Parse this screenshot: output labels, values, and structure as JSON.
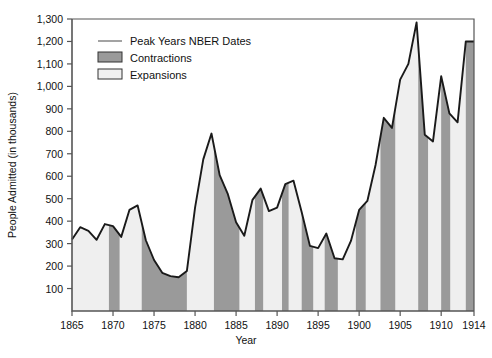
{
  "chart_data": {
    "type": "area",
    "title": "",
    "xlabel": "Year",
    "ylabel": "People Admitted (in thousands)",
    "xlim": [
      1865,
      1914
    ],
    "ylim": [
      0,
      1300
    ],
    "yticks": [
      100,
      200,
      300,
      400,
      500,
      600,
      700,
      800,
      900,
      1000,
      1100,
      1200,
      1300
    ],
    "ytick_labels": [
      "100",
      "200",
      "300",
      "400",
      "500",
      "600",
      "700",
      "800",
      "900",
      "1,000",
      "1,100",
      "1,200",
      "1,300"
    ],
    "xticks": [
      1865,
      1870,
      1875,
      1880,
      1885,
      1890,
      1895,
      1900,
      1905,
      1910,
      1914
    ],
    "xtick_labels": [
      "1865",
      "1870",
      "1875",
      "1880",
      "1885",
      "1890",
      "1895",
      "1900",
      "1905",
      "1910",
      "1914"
    ],
    "grid": false,
    "legend_position": "top-left",
    "legend": [
      {
        "label": "Peak Years NBER Dates",
        "marker": "line",
        "color": "#8c8c8c"
      },
      {
        "label": "Contractions",
        "marker": "swatch",
        "color": "#9a9a9a"
      },
      {
        "label": "Expansions",
        "marker": "swatch",
        "color": "#f0f0f0"
      }
    ],
    "series": [
      {
        "name": "People Admitted",
        "x": [
          1865,
          1866,
          1867,
          1868,
          1869,
          1870,
          1871,
          1872,
          1873,
          1874,
          1875,
          1876,
          1877,
          1878,
          1879,
          1880,
          1881,
          1882,
          1883,
          1884,
          1885,
          1886,
          1887,
          1888,
          1889,
          1890,
          1891,
          1892,
          1893,
          1894,
          1895,
          1896,
          1897,
          1898,
          1899,
          1900,
          1901,
          1902,
          1903,
          1904,
          1905,
          1906,
          1907,
          1908,
          1909,
          1910,
          1911,
          1912,
          1913,
          1914
        ],
        "values": [
          318,
          373,
          357,
          317,
          387,
          378,
          330,
          450,
          470,
          315,
          227,
          170,
          155,
          150,
          178,
          460,
          675,
          790,
          605,
          520,
          395,
          335,
          495,
          545,
          445,
          460,
          565,
          580,
          440,
          290,
          280,
          345,
          235,
          230,
          312,
          450,
          490,
          650,
          860,
          815,
          1030,
          1100,
          1285,
          785,
          755,
          1045,
          880,
          840,
          1200,
          1200
        ],
        "color": "#1a1a1a"
      }
    ],
    "shaded_bands": [
      {
        "type": "contraction",
        "start": 1869.5,
        "end": 1870.8
      },
      {
        "type": "contraction",
        "start": 1873.5,
        "end": 1879.0
      },
      {
        "type": "contraction",
        "start": 1882.3,
        "end": 1885.4
      },
      {
        "type": "contraction",
        "start": 1887.3,
        "end": 1888.3
      },
      {
        "type": "contraction",
        "start": 1890.6,
        "end": 1891.4
      },
      {
        "type": "contraction",
        "start": 1893.0,
        "end": 1894.4
      },
      {
        "type": "contraction",
        "start": 1895.8,
        "end": 1897.4
      },
      {
        "type": "contraction",
        "start": 1899.6,
        "end": 1900.8
      },
      {
        "type": "contraction",
        "start": 1902.6,
        "end": 1904.4
      },
      {
        "type": "contraction",
        "start": 1907.2,
        "end": 1908.4
      },
      {
        "type": "contraction",
        "start": 1910.0,
        "end": 1911.1
      },
      {
        "type": "contraction",
        "start": 1913.0,
        "end": 1914.0
      }
    ],
    "colors": {
      "contraction": "#9a9a9a",
      "expansion": "#efefef",
      "line": "#1a1a1a",
      "axis": "#555555",
      "background": "#ffffff"
    }
  }
}
